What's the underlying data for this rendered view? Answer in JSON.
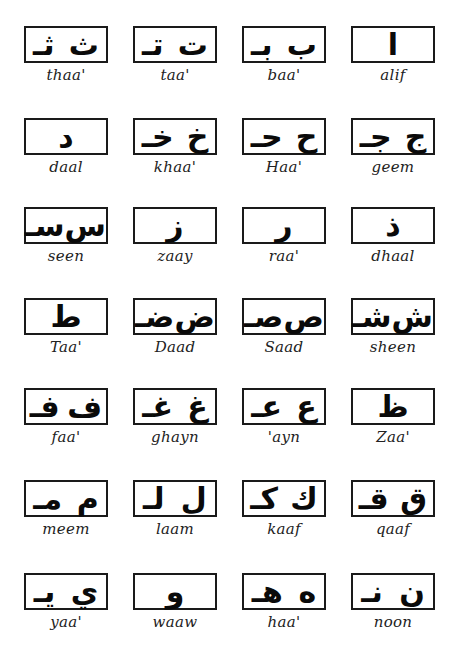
{
  "letters": [
    {
      "name": "thaa'",
      "forms": [
        "ث",
        "ثـ"
      ]
    },
    {
      "name": "taa'",
      "forms": [
        "ت",
        "تـ"
      ]
    },
    {
      "name": "baa'",
      "forms": [
        "ب",
        "بـ"
      ]
    },
    {
      "name": "alif",
      "forms": [
        "ا"
      ]
    },
    {
      "name": "daal",
      "forms": [
        "د"
      ]
    },
    {
      "name": "khaa'",
      "forms": [
        "خ",
        "خـ"
      ]
    },
    {
      "name": "Haa'",
      "forms": [
        "ح",
        "حـ"
      ]
    },
    {
      "name": "geem",
      "forms": [
        "ج",
        "جـ"
      ]
    },
    {
      "name": "seen",
      "forms": [
        "س",
        "سـ"
      ]
    },
    {
      "name": "zaay",
      "forms": [
        "ز"
      ]
    },
    {
      "name": "raa'",
      "forms": [
        "ر"
      ]
    },
    {
      "name": "dhaal",
      "forms": [
        "ذ"
      ]
    },
    {
      "name": "Taa'",
      "forms": [
        "ط"
      ]
    },
    {
      "name": "Daad",
      "forms": [
        "ض",
        "ضـ"
      ]
    },
    {
      "name": "Saad",
      "forms": [
        "ص",
        "صـ"
      ]
    },
    {
      "name": "sheen",
      "forms": [
        "ش",
        "شـ"
      ]
    },
    {
      "name": "faa'",
      "forms": [
        "ف",
        "فـ"
      ]
    },
    {
      "name": "ghayn",
      "forms": [
        "غ",
        "غـ"
      ]
    },
    {
      "name": "'ayn",
      "forms": [
        "ع",
        "عـ"
      ]
    },
    {
      "name": "Zaa'",
      "forms": [
        "ظ"
      ]
    },
    {
      "name": "meem",
      "forms": [
        "م",
        "مـ"
      ]
    },
    {
      "name": "laam",
      "forms": [
        "ل",
        "لـ"
      ]
    },
    {
      "name": "kaaf",
      "forms": [
        "ك",
        "كـ"
      ]
    },
    {
      "name": "qaaf",
      "forms": [
        "ق",
        "قـ"
      ]
    },
    {
      "name": "yaa'",
      "forms": [
        "ي",
        "يـ"
      ]
    },
    {
      "name": "waaw",
      "forms": [
        "و"
      ]
    },
    {
      "name": "haa'",
      "forms": [
        "ه",
        "هـ"
      ]
    },
    {
      "name": "noon",
      "forms": [
        "ن",
        "نـ"
      ]
    }
  ]
}
